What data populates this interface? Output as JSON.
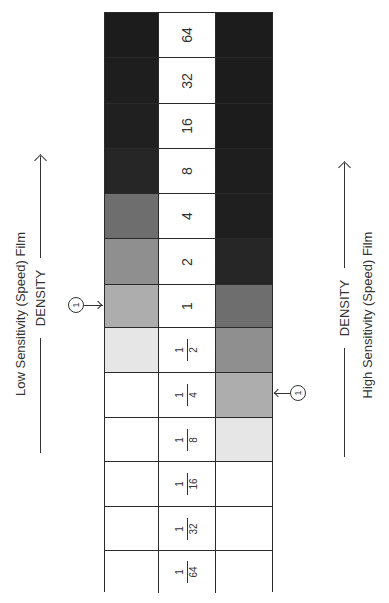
{
  "diagram": {
    "left_side": {
      "caption": "Low Sensitivity (Speed) Film",
      "axis_label": "DENSITY",
      "marker_label": "1"
    },
    "right_side": {
      "caption": "High Sensitivity (Speed) Film",
      "axis_label": "DENSITY",
      "marker_label": "1"
    },
    "rows": [
      {
        "exposure": "64",
        "is_fraction": false,
        "low_film_color": "#1c1c1c",
        "high_film_color": "#1c1c1c"
      },
      {
        "exposure": "32",
        "is_fraction": false,
        "low_film_color": "#1e1e1e",
        "high_film_color": "#1c1c1c"
      },
      {
        "exposure": "16",
        "is_fraction": false,
        "low_film_color": "#202020",
        "high_film_color": "#1c1c1c"
      },
      {
        "exposure": "8",
        "is_fraction": false,
        "low_film_color": "#262626",
        "high_film_color": "#1e1e1e"
      },
      {
        "exposure": "4",
        "is_fraction": false,
        "low_film_color": "#6e6e6e",
        "high_film_color": "#1f1f1f"
      },
      {
        "exposure": "2",
        "is_fraction": false,
        "low_film_color": "#8f8f8f",
        "high_film_color": "#262626"
      },
      {
        "exposure": "1",
        "is_fraction": false,
        "low_film_color": "#adadad",
        "high_film_color": "#6e6e6e"
      },
      {
        "exposure": "1/2",
        "is_fraction": true,
        "numerator": "1",
        "denominator": "2",
        "low_film_color": "#e6e6e6",
        "high_film_color": "#8f8f8f"
      },
      {
        "exposure": "1/4",
        "is_fraction": true,
        "numerator": "1",
        "denominator": "4",
        "low_film_color": "#ffffff",
        "high_film_color": "#adadad"
      },
      {
        "exposure": "1/8",
        "is_fraction": true,
        "numerator": "1",
        "denominator": "8",
        "low_film_color": "#ffffff",
        "high_film_color": "#e6e6e6"
      },
      {
        "exposure": "1/16",
        "is_fraction": true,
        "numerator": "1",
        "denominator": "16",
        "low_film_color": "#ffffff",
        "high_film_color": "#ffffff"
      },
      {
        "exposure": "1/32",
        "is_fraction": true,
        "numerator": "1",
        "denominator": "32",
        "low_film_color": "#ffffff",
        "high_film_color": "#ffffff"
      },
      {
        "exposure": "1/64",
        "is_fraction": true,
        "numerator": "1",
        "denominator": "64",
        "low_film_color": "#ffffff",
        "high_film_color": "#ffffff"
      }
    ],
    "row_edges_px": [
      12,
      57,
      103,
      148,
      193,
      238,
      284,
      327,
      372,
      417,
      461,
      506,
      550,
      592
    ],
    "markers": {
      "low_film_marker_row": "1",
      "high_film_marker_row": "1/4"
    }
  }
}
